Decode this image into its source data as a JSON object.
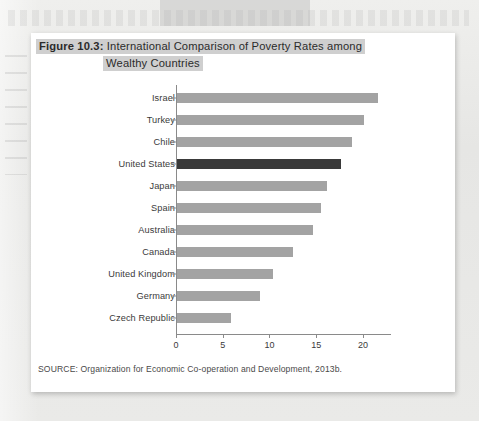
{
  "page": {
    "background_color": "#e9e9e7",
    "card_background": "#ffffff"
  },
  "figure": {
    "number_label": "Figure 10.3:",
    "title_line_1": "International Comparison of Poverty Rates among",
    "title_line_2": "Wealthy Countries",
    "title_highlight_color": "#cfcfcf",
    "source_note": "SOURCE: Organization for Economic Co-operation and Development, 2013b."
  },
  "chart_data": {
    "type": "bar",
    "orientation": "horizontal",
    "title": "Figure 10.3: International Comparison of Poverty Rates among Wealthy Countries",
    "xlabel": "",
    "ylabel": "",
    "xlim": [
      0,
      23
    ],
    "ylim": null,
    "grid": false,
    "legend": null,
    "bar_color": "#a3a3a3",
    "highlight_color": "#3a3a3a",
    "highlight_category": "United States",
    "xticks": [
      0,
      5,
      10,
      15,
      20
    ],
    "xtick_labels": [
      "0",
      "5",
      "10",
      "15",
      "20"
    ],
    "categories": [
      "Israel",
      "Turkey",
      "Chile",
      "United States",
      "Japan",
      "Spain",
      "Australia",
      "Canada",
      "United Kingdom",
      "Germany",
      "Czech Republic"
    ],
    "values": [
      21.5,
      20.0,
      18.7,
      17.5,
      16.0,
      15.4,
      14.5,
      12.4,
      10.3,
      8.9,
      5.8
    ]
  }
}
